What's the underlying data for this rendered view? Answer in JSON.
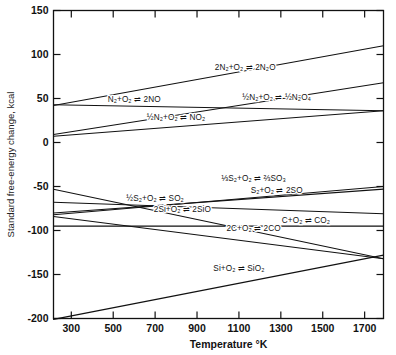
{
  "chart_data": {
    "type": "line",
    "title": "",
    "xlabel": "Temperature °K",
    "ylabel": "Standard free-energy change, kcal",
    "xlim": [
      215,
      1790
    ],
    "ylim": [
      -200,
      150
    ],
    "xticks": [
      300,
      500,
      700,
      900,
      1100,
      1300,
      1500,
      1700
    ],
    "yticks": [
      150,
      100,
      50,
      0,
      -50,
      -100,
      -150,
      -200
    ],
    "xtick_labels": [
      "300",
      "500",
      "700",
      "900",
      "1100",
      "1300",
      "1500",
      "1700"
    ],
    "ytick_labels": [
      "150",
      "100",
      "50",
      "0",
      "-50",
      "-100",
      "-150",
      "-200"
    ],
    "grid": false,
    "legend": "inline-labels",
    "series": [
      {
        "name": "2N₂+O₂ ⇌ 2N₂O",
        "label": "2N₂+O₂ ⇌ 2N₂O",
        "x": [
          215,
          1790
        ],
        "y": [
          42,
          110
        ],
        "label_x": 1130,
        "label_y": 82
      },
      {
        "name": "N₂+O₂ ⇌ 2NO",
        "label": "N₂+O₂ ⇌ 2NO",
        "x": [
          215,
          1790
        ],
        "y": [
          43,
          36
        ],
        "label_x": 600,
        "label_y": 46
      },
      {
        "name": "½N₂+O₂ ⇌ ½N₂O₄",
        "label": "½N₂+O₂ ⇌ ½N₂O₄",
        "x": [
          215,
          1790
        ],
        "y": [
          9,
          68
        ],
        "label_x": 1280,
        "label_y": 48
      },
      {
        "name": "½N₂+O₂ ⇌ NO₂",
        "label": "½N₂+O₂ ⇌ NO₂",
        "x": [
          215,
          1790
        ],
        "y": [
          7,
          36
        ],
        "label_x": 800,
        "label_y": 26
      },
      {
        "name": "⅓S₂+O₂ ⇌ ⅔SO₃",
        "label": "⅓S₂+O₂ ⇌ ⅔SO₃",
        "x": [
          215,
          1790
        ],
        "y": [
          -82,
          -50
        ],
        "label_x": 1170,
        "label_y": -44
      },
      {
        "name": "S₂+O₂ ⇌ 2SO",
        "label": "S₂+O₂ ⇌ 2SO",
        "x": [
          215,
          1790
        ],
        "y": [
          -80,
          -53
        ],
        "label_x": 1280,
        "label_y": -57
      },
      {
        "name": "½S₂+O₂ ⇌ SO₂",
        "label": "½S₂+O₂ ⇌ SO₂",
        "x": [
          215,
          1790
        ],
        "y": [
          -68,
          -81
        ],
        "label_x": 700,
        "label_y": -67
      },
      {
        "name": "2Si+O₂ ⇌ 2SiO",
        "label": "2Si+O₂ ⇌ 2SiO",
        "x": [
          215,
          1790
        ],
        "y": [
          -84,
          -132
        ],
        "label_x": 830,
        "label_y": -79
      },
      {
        "name": "C+O₂ ⇌ CO₂",
        "label": "C+O₂ ⇌ CO₂",
        "x": [
          215,
          1790
        ],
        "y": [
          -95,
          -95
        ],
        "label_x": 1420,
        "label_y": -91
      },
      {
        "name": "2C+O₂ ⇌ 2CO",
        "label": "2C+O₂ ⇌ 2CO",
        "x": [
          215,
          1790
        ],
        "y": [
          -53,
          -132
        ],
        "label_x": 1170,
        "label_y": -100
      },
      {
        "name": "Si+O₂ ⇌ SiO₂",
        "label": "Si+O₂ ⇌ SiO₂",
        "x": [
          215,
          1790
        ],
        "y": [
          -201,
          -128
        ],
        "label_x": 1100,
        "label_y": -146
      }
    ]
  }
}
